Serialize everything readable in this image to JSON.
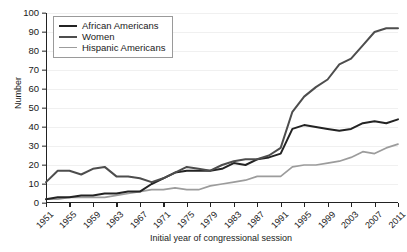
{
  "chart_data": {
    "type": "line",
    "title": "",
    "xlabel": "Initial year of congressional session",
    "ylabel": "Number",
    "xlim": [
      1951,
      2011
    ],
    "ylim": [
      0,
      100
    ],
    "grid": true,
    "legend_position": "top-left",
    "x_tick_labels": [
      "1951",
      "1955",
      "1959",
      "1963",
      "1967",
      "1971",
      "1975",
      "1979",
      "1983",
      "1987",
      "1991",
      "1995",
      "1999",
      "2003",
      "2007",
      "2011"
    ],
    "y_tick_labels": [
      "0",
      "10",
      "20",
      "30",
      "40",
      "50",
      "60",
      "70",
      "80",
      "90",
      "100"
    ],
    "x": [
      1951,
      1953,
      1955,
      1957,
      1959,
      1961,
      1963,
      1965,
      1967,
      1969,
      1971,
      1973,
      1975,
      1977,
      1979,
      1981,
      1983,
      1985,
      1987,
      1989,
      1991,
      1993,
      1995,
      1997,
      1999,
      2001,
      2003,
      2005,
      2007,
      2009,
      2011
    ],
    "series": [
      {
        "name": "African Americans",
        "color": "#232323",
        "values": [
          2,
          3,
          3,
          4,
          4,
          5,
          5,
          6,
          6,
          10,
          13,
          16,
          17,
          17,
          17,
          18,
          21,
          20,
          23,
          24,
          26,
          39,
          41,
          40,
          39,
          38,
          39,
          42,
          43,
          42,
          44
        ]
      },
      {
        "name": "Women",
        "color": "#4d4d4d",
        "values": [
          11,
          17,
          17,
          15,
          18,
          19,
          14,
          14,
          13,
          11,
          13,
          16,
          19,
          18,
          17,
          20,
          22,
          23,
          23,
          25,
          29,
          48,
          56,
          61,
          65,
          73,
          76,
          83,
          90,
          92,
          92
        ]
      },
      {
        "name": "Hispanic Americans",
        "color": "#9c9c9c",
        "values": [
          2,
          2,
          3,
          3,
          3,
          3,
          4,
          5,
          6,
          7,
          7,
          8,
          7,
          7,
          9,
          10,
          11,
          12,
          14,
          14,
          14,
          19,
          20,
          20,
          21,
          22,
          24,
          27,
          26,
          29,
          31
        ]
      }
    ]
  },
  "legend": {
    "items": [
      {
        "label": "African Americans"
      },
      {
        "label": "Women"
      },
      {
        "label": "Hispanic Americans"
      }
    ]
  }
}
